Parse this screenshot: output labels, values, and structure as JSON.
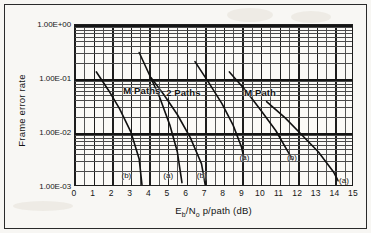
{
  "figure": {
    "caption_none": "",
    "axis": {
      "y_title": "Frame error rate",
      "x_title_main": "E",
      "x_title_sub1": "b",
      "x_title_mid": "/N",
      "x_title_sub2": "o",
      "x_title_tail": " p/path (dB)",
      "x_title_full": "Eb/No p/path (dB)"
    }
  },
  "chart_data": {
    "type": "line",
    "title": "",
    "xlabel": "Eb/No p/path (dB)",
    "ylabel": "Frame error rate",
    "xlim": [
      0,
      15
    ],
    "ylim": [
      0.001,
      1
    ],
    "yscale": "log",
    "xscale": "linear",
    "grid": "major and minor log grid",
    "legend": "inline annotations",
    "xticks": [
      "0",
      "1",
      "2",
      "3",
      "4",
      "5",
      "6",
      "7",
      "8",
      "9",
      "10",
      "11",
      "12",
      "13",
      "14",
      "15"
    ],
    "yticks": [
      "1.00E+00",
      "1.00E-01",
      "1.00E-02",
      "1.00E-03"
    ],
    "ytick_values": [
      1,
      0.1,
      0.01,
      0.001
    ],
    "group_labels": [
      {
        "text": "M Paths",
        "x": 2.6,
        "y": 0.06
      },
      {
        "text": "2 Paths",
        "x": 4.9,
        "y": 0.055
      },
      {
        "text": "M Path",
        "x": 9.1,
        "y": 0.055
      }
    ],
    "series": [
      {
        "name": "M Paths (b)",
        "label": "(b)",
        "label_x": 2.5,
        "label_y": 0.0016,
        "points": [
          [
            1.15,
            0.135
          ],
          [
            1.8,
            0.062
          ],
          [
            2.4,
            0.028
          ],
          [
            3.0,
            0.0105
          ],
          [
            3.45,
            0.0033
          ],
          [
            3.6,
            0.0011
          ]
        ]
      },
      {
        "name": "2 Paths (a)",
        "label": "(a)",
        "label_x": 4.75,
        "label_y": 0.0016,
        "points": [
          [
            3.45,
            0.31
          ],
          [
            4.0,
            0.12
          ],
          [
            4.55,
            0.046
          ],
          [
            5.1,
            0.014
          ],
          [
            5.5,
            0.0045
          ],
          [
            5.75,
            0.0012
          ]
        ]
      },
      {
        "name": "2 Paths (b)",
        "label": "(b)",
        "label_x": 6.55,
        "label_y": 0.0016,
        "points": [
          [
            4.1,
            0.105
          ],
          [
            4.8,
            0.05
          ],
          [
            5.5,
            0.022
          ],
          [
            6.2,
            0.0082
          ],
          [
            6.8,
            0.0027
          ],
          [
            7.0,
            0.0011
          ]
        ]
      },
      {
        "name": "1 Path (a)",
        "label": "(a)",
        "label_x": 8.85,
        "label_y": 0.0035,
        "points": [
          [
            6.45,
            0.21
          ],
          [
            7.2,
            0.085
          ],
          [
            7.9,
            0.035
          ],
          [
            8.5,
            0.014
          ],
          [
            8.95,
            0.0055
          ],
          [
            9.1,
            0.0033
          ]
        ]
      },
      {
        "name": "1 Path (b)",
        "label": "(b)",
        "label_x": 11.4,
        "label_y": 0.0035,
        "points": [
          [
            8.3,
            0.135
          ],
          [
            9.2,
            0.06
          ],
          [
            10.0,
            0.026
          ],
          [
            10.8,
            0.011
          ],
          [
            11.4,
            0.0048
          ],
          [
            11.7,
            0.0032
          ]
        ]
      },
      {
        "name": "1 Path (a) right",
        "label": "(a)",
        "label_x": 14.2,
        "label_y": 0.0013,
        "points": [
          [
            10.3,
            0.038
          ],
          [
            11.3,
            0.019
          ],
          [
            12.2,
            0.0092
          ],
          [
            13.1,
            0.0044
          ],
          [
            13.9,
            0.0019
          ],
          [
            14.15,
            0.0013
          ]
        ]
      }
    ]
  },
  "colors": {
    "curve": "#101010",
    "grid_major": "#141414",
    "grid_minor": "#4a4a4a",
    "frame": "#2a2a2a",
    "background": "#f8f7f4"
  }
}
